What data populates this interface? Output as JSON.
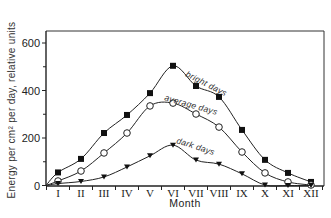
{
  "chart_data": {
    "type": "line",
    "title": "",
    "xlabel": "Month",
    "ylabel": "Energy per cm² per day, relative units",
    "categories": [
      "I",
      "II",
      "III",
      "IV",
      "V",
      "VI",
      "VII",
      "VIII",
      "IX",
      "X",
      "XI",
      "XII"
    ],
    "ylim": [
      0,
      650
    ],
    "yticks": [
      0,
      200,
      400,
      600
    ],
    "ytick_labels": [
      "0",
      "200",
      "400",
      "600"
    ],
    "minor_yticks": [
      100,
      300,
      500
    ],
    "grid": false,
    "legend_position": "inline labels along curves",
    "series": [
      {
        "name": "bright days",
        "marker": "filled-square",
        "values": [
          55,
          112,
          221,
          297,
          389,
          504,
          419,
          373,
          234,
          108,
          53,
          15
        ]
      },
      {
        "name": "average days",
        "marker": "open-circle",
        "values": [
          19,
          61,
          137,
          221,
          335,
          347,
          301,
          246,
          141,
          53,
          15,
          2
        ]
      },
      {
        "name": "dark days",
        "marker": "filled-triangle-down",
        "values": [
          8,
          17,
          36,
          78,
          125,
          170,
          107,
          90,
          49,
          2,
          0,
          0
        ]
      }
    ]
  },
  "labels": {
    "xlabel": "Month",
    "ylabel": "Energy per cm² per day, relative units",
    "bright": "bright days",
    "average": "average days",
    "dark": "dark days"
  }
}
